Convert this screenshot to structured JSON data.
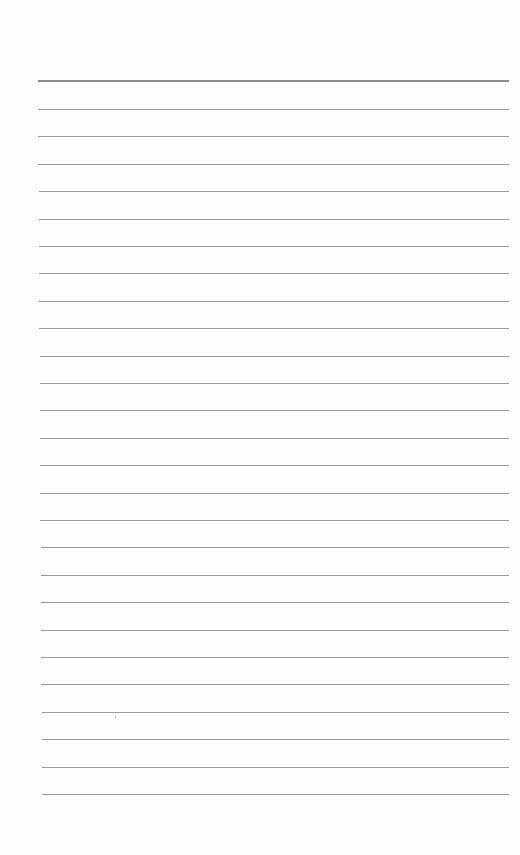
{
  "page": {
    "type": "lined-paper",
    "background": "#fdfdfd",
    "line_color": "#9a9a9a",
    "header_line_color": "#8c8c8c",
    "text": ""
  },
  "rules": {
    "header_line_y": 81,
    "first_line_y": 109,
    "spacing": 27.4,
    "count": 26,
    "left_top": 38,
    "left_bottom": 42,
    "right": 509
  }
}
